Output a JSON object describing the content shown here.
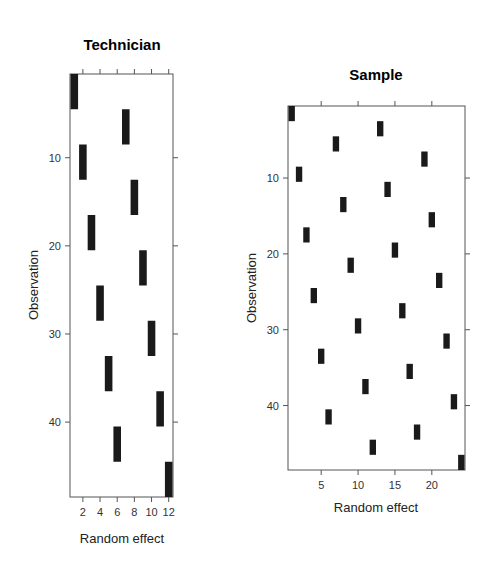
{
  "chart_data": [
    {
      "type": "heatmap",
      "title": "Technician",
      "xlabel": "Random effect",
      "ylabel": "Observation",
      "xlim": [
        0.5,
        12.5
      ],
      "ylim": [
        48.5,
        0.5
      ],
      "x_ticks": [
        2,
        4,
        6,
        8,
        10,
        12
      ],
      "y_ticks": [
        10,
        20,
        30,
        40
      ],
      "grid": false,
      "description": "Indicator matrix: observation rows vs technician random-effect columns; each technician covers 4 consecutive observations",
      "blocks": [
        {
          "effect": 1,
          "obs_start": 1,
          "obs_end": 4
        },
        {
          "effect": 7,
          "obs_start": 5,
          "obs_end": 8
        },
        {
          "effect": 2,
          "obs_start": 9,
          "obs_end": 12
        },
        {
          "effect": 8,
          "obs_start": 13,
          "obs_end": 16
        },
        {
          "effect": 3,
          "obs_start": 17,
          "obs_end": 20
        },
        {
          "effect": 9,
          "obs_start": 21,
          "obs_end": 24
        },
        {
          "effect": 4,
          "obs_start": 25,
          "obs_end": 28
        },
        {
          "effect": 10,
          "obs_start": 29,
          "obs_end": 32
        },
        {
          "effect": 5,
          "obs_start": 33,
          "obs_end": 36
        },
        {
          "effect": 11,
          "obs_start": 37,
          "obs_end": 40
        },
        {
          "effect": 6,
          "obs_start": 41,
          "obs_end": 44
        },
        {
          "effect": 12,
          "obs_start": 45,
          "obs_end": 48
        }
      ]
    },
    {
      "type": "heatmap",
      "title": "Sample",
      "xlabel": "Random effect",
      "ylabel": "Observation",
      "xlim": [
        0.5,
        24.5
      ],
      "ylim": [
        48.5,
        0.5
      ],
      "x_ticks": [
        5,
        10,
        15,
        20
      ],
      "y_ticks": [
        10,
        20,
        30,
        40
      ],
      "grid": false,
      "description": "Indicator matrix: observation rows vs sample random-effect columns; each sample covers 2 consecutive observations",
      "blocks": [
        {
          "effect": 1,
          "obs_start": 1,
          "obs_end": 2
        },
        {
          "effect": 13,
          "obs_start": 3,
          "obs_end": 4
        },
        {
          "effect": 7,
          "obs_start": 5,
          "obs_end": 6
        },
        {
          "effect": 19,
          "obs_start": 7,
          "obs_end": 8
        },
        {
          "effect": 2,
          "obs_start": 9,
          "obs_end": 10
        },
        {
          "effect": 14,
          "obs_start": 11,
          "obs_end": 12
        },
        {
          "effect": 8,
          "obs_start": 13,
          "obs_end": 14
        },
        {
          "effect": 20,
          "obs_start": 15,
          "obs_end": 16
        },
        {
          "effect": 3,
          "obs_start": 17,
          "obs_end": 18
        },
        {
          "effect": 15,
          "obs_start": 19,
          "obs_end": 20
        },
        {
          "effect": 9,
          "obs_start": 21,
          "obs_end": 22
        },
        {
          "effect": 21,
          "obs_start": 23,
          "obs_end": 24
        },
        {
          "effect": 4,
          "obs_start": 25,
          "obs_end": 26
        },
        {
          "effect": 16,
          "obs_start": 27,
          "obs_end": 28
        },
        {
          "effect": 10,
          "obs_start": 29,
          "obs_end": 30
        },
        {
          "effect": 22,
          "obs_start": 31,
          "obs_end": 32
        },
        {
          "effect": 5,
          "obs_start": 33,
          "obs_end": 34
        },
        {
          "effect": 17,
          "obs_start": 35,
          "obs_end": 36
        },
        {
          "effect": 11,
          "obs_start": 37,
          "obs_end": 38
        },
        {
          "effect": 23,
          "obs_start": 39,
          "obs_end": 40
        },
        {
          "effect": 6,
          "obs_start": 41,
          "obs_end": 42
        },
        {
          "effect": 18,
          "obs_start": 43,
          "obs_end": 44
        },
        {
          "effect": 12,
          "obs_start": 45,
          "obs_end": 46
        },
        {
          "effect": 24,
          "obs_start": 47,
          "obs_end": 48
        }
      ]
    }
  ],
  "colors": {
    "block": "#1a1a1a",
    "frame": "#555555",
    "background": "#ffffff"
  }
}
